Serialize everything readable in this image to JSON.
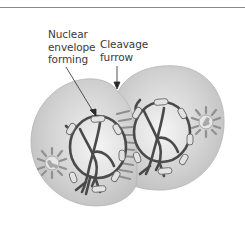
{
  "figure": {
    "type": "cell-division-diagram",
    "stage": "telophase-cytokinesis",
    "labels": [
      {
        "id": "nuclear-envelope",
        "text": "Nuclear\nenvelope\nforming"
      },
      {
        "id": "cleavage-furrow",
        "text": "Cleavage\nfurrow"
      }
    ],
    "colors": {
      "cell_fill": "#c9c9c9",
      "cell_fill_light": "#e6e6e6",
      "chromosome": "#4a4a4a",
      "envelope_fragment": "#e0e0e0",
      "microtubule": "#8a8a8a",
      "rule": "#8a8a8a"
    }
  }
}
